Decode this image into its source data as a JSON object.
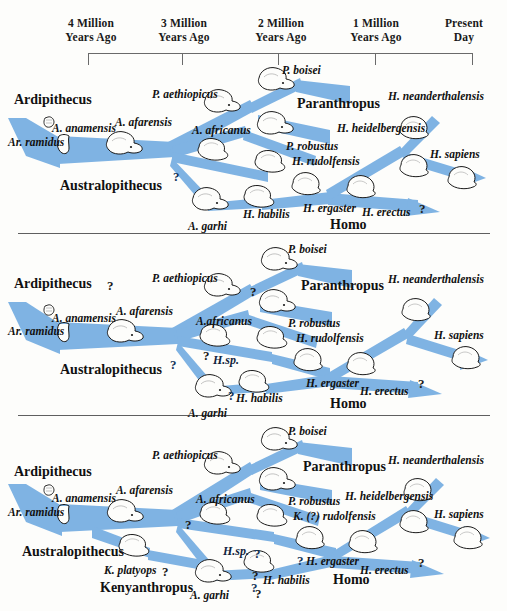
{
  "figure": {
    "branch_color": "#7fb3e3",
    "branch_color_dark": "#6aa4dc",
    "outline_color": "#1a1a1a",
    "background": "#fdfdfb"
  },
  "timeline": {
    "labels": [
      {
        "line1": "4 Million",
        "line2": "Years Ago"
      },
      {
        "line1": "3 Million",
        "line2": "Years Ago"
      },
      {
        "line1": "2 Million",
        "line2": "Years Ago"
      },
      {
        "line1": "1 Million",
        "line2": "Years Ago"
      },
      {
        "line1": "Present",
        "line2": "Day"
      }
    ],
    "tick_count": 4
  },
  "panels": [
    {
      "id": "panel-1",
      "labels": [
        {
          "text": "Ardipithecus",
          "style": "genus",
          "x": 14,
          "y": 32
        },
        {
          "text": "Ar. ramidus",
          "style": "sp",
          "x": 8,
          "y": 76
        },
        {
          "text": "A. anamensis",
          "style": "sp",
          "x": 52,
          "y": 62
        },
        {
          "text": "A. afarensis",
          "style": "sp",
          "x": 115,
          "y": 56
        },
        {
          "text": "Australopithecus",
          "style": "genus",
          "x": 60,
          "y": 118
        },
        {
          "text": "P. aethiopicus",
          "style": "sp",
          "x": 152,
          "y": 28
        },
        {
          "text": "A. africanus",
          "style": "sp",
          "x": 192,
          "y": 64
        },
        {
          "text": "A. garhi",
          "style": "sp",
          "x": 188,
          "y": 160
        },
        {
          "text": "P. boisei",
          "style": "sp",
          "x": 282,
          "y": 4
        },
        {
          "text": "Paranthropus",
          "style": "genus",
          "x": 297,
          "y": 36
        },
        {
          "text": "P. robustus",
          "style": "sp",
          "x": 286,
          "y": 80
        },
        {
          "text": "H. rudolfensis",
          "style": "sp",
          "x": 292,
          "y": 95
        },
        {
          "text": "H. habilis",
          "style": "sp",
          "x": 243,
          "y": 148
        },
        {
          "text": "H. ergaster",
          "style": "sp",
          "x": 303,
          "y": 142
        },
        {
          "text": "H. erectus",
          "style": "sp",
          "x": 362,
          "y": 146
        },
        {
          "text": "Homo",
          "style": "genus",
          "x": 330,
          "y": 157
        },
        {
          "text": "H. heidelbergensis",
          "style": "sp",
          "x": 337,
          "y": 62
        },
        {
          "text": "H. neanderthalensis",
          "style": "sp",
          "x": 388,
          "y": 30
        },
        {
          "text": "H. sapiens",
          "style": "sp",
          "x": 430,
          "y": 88
        },
        {
          "text": "?",
          "style": "qm-blue",
          "x": 173,
          "y": 109
        },
        {
          "text": "?",
          "style": "qm",
          "x": 419,
          "y": 141
        }
      ]
    },
    {
      "id": "panel-2",
      "labels": [
        {
          "text": "Ardipithecus",
          "style": "genus",
          "x": 14,
          "y": 36
        },
        {
          "text": "Ar. ramidus",
          "style": "sp",
          "x": 8,
          "y": 85
        },
        {
          "text": "A. anamensis",
          "style": "sp",
          "x": 52,
          "y": 72
        },
        {
          "text": "A. afarensis",
          "style": "sp",
          "x": 116,
          "y": 65
        },
        {
          "text": "Australopithecus",
          "style": "genus",
          "x": 60,
          "y": 122
        },
        {
          "text": "P. aethiopicus",
          "style": "sp",
          "x": 152,
          "y": 32
        },
        {
          "text": "A.africanus",
          "style": "sp",
          "x": 196,
          "y": 75
        },
        {
          "text": "A. garhi",
          "style": "sp",
          "x": 188,
          "y": 167
        },
        {
          "text": "P. boisei",
          "style": "sp",
          "x": 288,
          "y": 3
        },
        {
          "text": "Paranthropus",
          "style": "genus",
          "x": 301,
          "y": 38
        },
        {
          "text": "P. robustus",
          "style": "sp",
          "x": 288,
          "y": 77
        },
        {
          "text": "H. rudolfensis",
          "style": "sp",
          "x": 296,
          "y": 92
        },
        {
          "text": "H. habilis",
          "style": "sp",
          "x": 236,
          "y": 152
        },
        {
          "text": "H. ergaster",
          "style": "sp",
          "x": 306,
          "y": 137
        },
        {
          "text": "H. erectus",
          "style": "sp",
          "x": 360,
          "y": 145
        },
        {
          "text": "Homo",
          "style": "genus",
          "x": 330,
          "y": 156
        },
        {
          "text": "H. neanderthalensis",
          "style": "sp",
          "x": 388,
          "y": 33
        },
        {
          "text": "H. sapiens",
          "style": "sp",
          "x": 434,
          "y": 89
        },
        {
          "text": "H.sp.",
          "style": "hsp",
          "x": 213,
          "y": 113
        },
        {
          "text": "?",
          "style": "qm",
          "x": 107,
          "y": 38
        },
        {
          "text": "?",
          "style": "qm",
          "x": 250,
          "y": 44
        },
        {
          "text": "?",
          "style": "qm-blue",
          "x": 170,
          "y": 117
        },
        {
          "text": "?",
          "style": "qm",
          "x": 203,
          "y": 108
        },
        {
          "text": "?",
          "style": "qm-blue",
          "x": 228,
          "y": 148
        },
        {
          "text": "?",
          "style": "qm",
          "x": 418,
          "y": 136
        }
      ]
    },
    {
      "id": "panel-3",
      "labels": [
        {
          "text": "Ardipithecus",
          "style": "genus",
          "x": 14,
          "y": 42
        },
        {
          "text": "Ar. ramidus",
          "style": "sp",
          "x": 8,
          "y": 84
        },
        {
          "text": "A. anamensis",
          "style": "sp",
          "x": 52,
          "y": 70
        },
        {
          "text": "A. afarensis",
          "style": "sp",
          "x": 116,
          "y": 62
        },
        {
          "text": "Australopithecus",
          "style": "genus",
          "x": 22,
          "y": 122
        },
        {
          "text": "K. platyops",
          "style": "sp",
          "x": 104,
          "y": 142
        },
        {
          "text": "Kenyanthropus",
          "style": "genus",
          "x": 100,
          "y": 158
        },
        {
          "text": "P. aethiopicus",
          "style": "sp",
          "x": 152,
          "y": 27
        },
        {
          "text": "A. africanus",
          "style": "sp",
          "x": 196,
          "y": 71
        },
        {
          "text": "A. garhi",
          "style": "sp",
          "x": 190,
          "y": 167
        },
        {
          "text": "P. boisei",
          "style": "sp",
          "x": 288,
          "y": 3
        },
        {
          "text": "Paranthropus",
          "style": "genus",
          "x": 303,
          "y": 37
        },
        {
          "text": "P. robustus",
          "style": "sp",
          "x": 288,
          "y": 73
        },
        {
          "text": "K. (?) rudolfensis",
          "style": "sp",
          "x": 293,
          "y": 88
        },
        {
          "text": "H. habilis",
          "style": "sp",
          "x": 263,
          "y": 152
        },
        {
          "text": "H. ergaster",
          "style": "sp",
          "x": 306,
          "y": 133
        },
        {
          "text": "H. erectus",
          "style": "sp",
          "x": 360,
          "y": 142
        },
        {
          "text": "Homo",
          "style": "genus",
          "x": 333,
          "y": 150
        },
        {
          "text": "H. heidelbergensis",
          "style": "sp",
          "x": 345,
          "y": 68
        },
        {
          "text": "H. neanderthalensis",
          "style": "sp",
          "x": 388,
          "y": 32
        },
        {
          "text": "H. sapiens",
          "style": "sp",
          "x": 434,
          "y": 86
        },
        {
          "text": "H.sp.",
          "style": "hsp",
          "x": 223,
          "y": 122
        },
        {
          "text": "?",
          "style": "qm",
          "x": 185,
          "y": 95
        },
        {
          "text": "?",
          "style": "qm",
          "x": 162,
          "y": 142
        },
        {
          "text": "?",
          "style": "qm-blue",
          "x": 254,
          "y": 124
        },
        {
          "text": "?",
          "style": "qm",
          "x": 252,
          "y": 146
        },
        {
          "text": "?",
          "style": "qm-blue",
          "x": 297,
          "y": 131
        },
        {
          "text": "?",
          "style": "qm-blue",
          "x": 251,
          "y": 158
        },
        {
          "text": "?",
          "style": "qm",
          "x": 255,
          "y": 164
        },
        {
          "text": "?",
          "style": "qm",
          "x": 418,
          "y": 133
        }
      ]
    }
  ]
}
